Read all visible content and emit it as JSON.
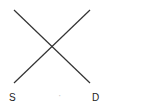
{
  "diagram": {
    "type": "supply-demand",
    "line_color": "#333333",
    "labels": {
      "supply": "S",
      "demand": "D",
      "middle_dot": "·"
    },
    "lines": {
      "demand": {
        "x1": 14,
        "y1": 10,
        "x2": 90,
        "y2": 83
      },
      "supply": {
        "x1": 14,
        "y1": 83,
        "x2": 90,
        "y2": 10
      }
    }
  }
}
